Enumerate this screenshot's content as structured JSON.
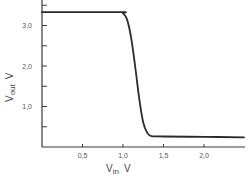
{
  "chart_data": {
    "type": "line",
    "title": "",
    "xlabel": "V_in  V",
    "ylabel": "V_out  V",
    "xlabel_main": "V",
    "xlabel_sub": "in",
    "xlabel_unit": "V",
    "ylabel_main": "V",
    "ylabel_sub": "out",
    "ylabel_unit": "V",
    "xlim": [
      0,
      2.5
    ],
    "ylim": [
      0,
      3.6
    ],
    "x_ticks": [
      0.5,
      1.0,
      1.5,
      2.0
    ],
    "x_tick_labels": [
      "0,5",
      "1,0",
      "1,5",
      "2,0"
    ],
    "y_ticks": [
      0.5,
      1.0,
      1.5,
      2.0,
      2.5,
      3.0,
      3.5
    ],
    "y_tick_labels": [
      "",
      "1,0",
      "",
      "2,0",
      "",
      "3,0",
      ""
    ],
    "grid": false,
    "legend": null,
    "series": [
      {
        "name": "V_out vs V_in",
        "x": [
          0.0,
          0.95,
          1.0,
          1.05,
          1.1,
          1.15,
          1.2,
          1.25,
          1.3,
          1.35,
          1.5,
          2.0,
          2.5
        ],
        "y": [
          3.33,
          3.33,
          3.3,
          3.15,
          2.7,
          2.0,
          1.2,
          0.6,
          0.35,
          0.27,
          0.26,
          0.25,
          0.24
        ]
      }
    ]
  },
  "colors": {
    "line": "#2b2b2b",
    "axis": "#3a3a3a",
    "text": "#555555"
  }
}
